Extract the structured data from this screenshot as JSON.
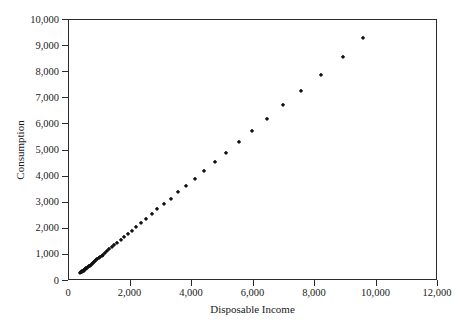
{
  "chart_data": {
    "type": "scatter",
    "title": "",
    "xlabel": "Disposable Income",
    "ylabel": "Consumption",
    "xlim": [
      0,
      12000
    ],
    "ylim": [
      0,
      10000
    ],
    "grid": false,
    "legend": null,
    "marker": {
      "shape": "diamond",
      "color": "#111111",
      "size_px": 3.2
    },
    "xticks": [
      0,
      2000,
      4000,
      6000,
      8000,
      10000,
      12000
    ],
    "xticklabels": [
      "0",
      "2,000",
      "4,000",
      "6,000",
      "8,000",
      "10,000",
      "12,000"
    ],
    "yticks": [
      0,
      1000,
      2000,
      3000,
      4000,
      5000,
      6000,
      7000,
      8000,
      9000,
      10000
    ],
    "yticklabels": [
      "0",
      "1,000",
      "2,000",
      "3,000",
      "4,000",
      "5,000",
      "6,000",
      "7,000",
      "8,000",
      "9,000",
      "10,000"
    ],
    "points": [
      [
        372,
        314
      ],
      [
        390,
        329
      ],
      [
        405,
        341
      ],
      [
        421,
        357
      ],
      [
        437,
        369
      ],
      [
        455,
        386
      ],
      [
        474,
        401
      ],
      [
        495,
        419
      ],
      [
        518,
        441
      ],
      [
        541,
        463
      ],
      [
        564,
        482
      ],
      [
        590,
        507
      ],
      [
        618,
        531
      ],
      [
        647,
        558
      ],
      [
        678,
        588
      ],
      [
        709,
        617
      ],
      [
        742,
        648
      ],
      [
        774,
        679
      ],
      [
        810,
        713
      ],
      [
        846,
        748
      ],
      [
        884,
        786
      ],
      [
        925,
        826
      ],
      [
        968,
        868
      ],
      [
        1014,
        912
      ],
      [
        1064,
        961
      ],
      [
        1119,
        1013
      ],
      [
        1179,
        1072
      ],
      [
        1243,
        1135
      ],
      [
        1315,
        1207
      ],
      [
        1394,
        1285
      ],
      [
        1479,
        1368
      ],
      [
        1573,
        1459
      ],
      [
        1676,
        1560
      ],
      [
        1788,
        1670
      ],
      [
        1910,
        1788
      ],
      [
        2043,
        1919
      ],
      [
        2188,
        2062
      ],
      [
        2342,
        2215
      ],
      [
        2508,
        2378
      ],
      [
        2685,
        2552
      ],
      [
        2876,
        2740
      ],
      [
        3083,
        2941
      ],
      [
        3304,
        3158
      ],
      [
        3545,
        3392
      ],
      [
        3805,
        3647
      ],
      [
        4089,
        3925
      ],
      [
        4398,
        4228
      ],
      [
        4738,
        4559
      ],
      [
        5108,
        4920
      ],
      [
        5513,
        5314
      ],
      [
        5956,
        5744
      ],
      [
        6441,
        6214
      ],
      [
        6973,
        6729
      ],
      [
        7556,
        7293
      ],
      [
        8195,
        7911
      ],
      [
        8898,
        8589
      ],
      [
        9560,
        9310
      ]
    ]
  },
  "axes": {
    "y_title": "Consumption",
    "x_title": "Disposable Income"
  }
}
